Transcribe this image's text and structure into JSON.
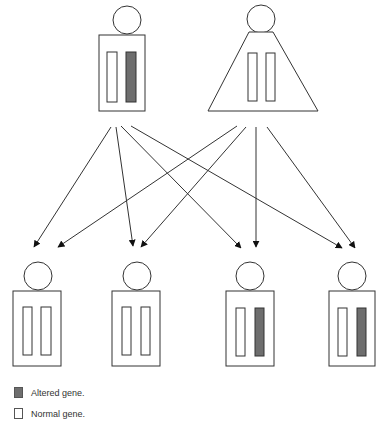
{
  "colors": {
    "line": "#333333",
    "altered_gene": "#6e6e6e",
    "normal_gene": "#ffffff",
    "background": "#ffffff"
  },
  "parents": [
    {
      "id": "parent-male",
      "shape": "rectangle",
      "genes": [
        "normal",
        "altered"
      ]
    },
    {
      "id": "parent-female",
      "shape": "triangle",
      "genes": [
        "normal",
        "normal"
      ]
    }
  ],
  "children": [
    {
      "id": "child-1",
      "genes": [
        "normal",
        "normal"
      ]
    },
    {
      "id": "child-2",
      "genes": [
        "normal",
        "normal"
      ]
    },
    {
      "id": "child-3",
      "genes": [
        "normal",
        "altered"
      ]
    },
    {
      "id": "child-4",
      "genes": [
        "normal",
        "altered"
      ]
    }
  ],
  "legend": {
    "altered_label": "Altered gene.",
    "normal_label": "Normal gene."
  }
}
